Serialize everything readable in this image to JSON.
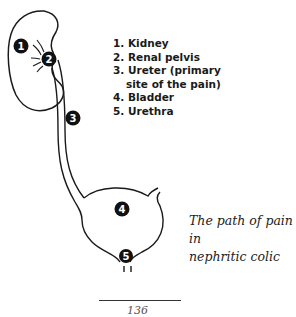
{
  "diagram": {
    "labels": [
      {
        "number": "1",
        "target": "kidney"
      },
      {
        "number": "2",
        "target": "renal-pelvis"
      },
      {
        "number": "3",
        "target": "ureter"
      },
      {
        "number": "4",
        "target": "bladder"
      },
      {
        "number": "5",
        "target": "urethra"
      }
    ]
  },
  "legend": {
    "items": [
      {
        "text": "1. Kidney"
      },
      {
        "text": "2. Renal pelvis"
      },
      {
        "text": "3. Ureter (primary"
      },
      {
        "text": "site of the pain)"
      },
      {
        "text": "4. Bladder"
      },
      {
        "text": "5. Urethra"
      }
    ]
  },
  "caption": {
    "line1": "The path of pain in",
    "line2": "nephritic colic"
  },
  "page": {
    "number": "136"
  },
  "colors": {
    "ink": "#1a1a1a",
    "background": "#ffffff"
  }
}
